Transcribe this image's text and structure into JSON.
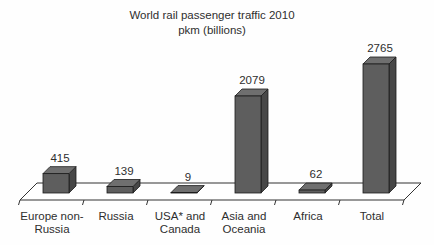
{
  "chart_data": {
    "type": "bar",
    "style": "3d-column",
    "title": "World rail passenger traffic 2010",
    "subtitle": "pkm (billions)",
    "xlabel": "",
    "ylabel": "",
    "ylim": [
      0,
      2900
    ],
    "grid": false,
    "legend": "none",
    "data_labels_shown": true,
    "categories": [
      "Europe non-Russia",
      "Russia",
      "USA* and Canada",
      "Asia and Oceania",
      "Africa",
      "Total"
    ],
    "values": [
      415,
      139,
      9,
      2079,
      62,
      2765
    ],
    "bars": [
      {
        "name": "Europe non-Russia",
        "label_lines": [
          "Europe non-",
          "Russia"
        ],
        "value": 415
      },
      {
        "name": "Russia",
        "label_lines": [
          "Russia"
        ],
        "value": 139
      },
      {
        "name": "USA* and Canada",
        "label_lines": [
          "USA* and",
          "Canada"
        ],
        "value": 9
      },
      {
        "name": "Asia and Oceania",
        "label_lines": [
          "Asia and",
          "Oceania"
        ],
        "value": 2079
      },
      {
        "name": "Africa",
        "label_lines": [
          "Africa"
        ],
        "value": 62
      },
      {
        "name": "Total",
        "label_lines": [
          "Total"
        ],
        "value": 2765
      }
    ],
    "colors": {
      "bar_front": "#5e5e5e",
      "bar_top": "#6f6f6f",
      "bar_side": "#474747",
      "bar_edge": "#1c1c1c",
      "axis": "#333333",
      "text": "#2e2e2e",
      "floor_fill": "#ffffff",
      "background": "#fefefe"
    }
  }
}
